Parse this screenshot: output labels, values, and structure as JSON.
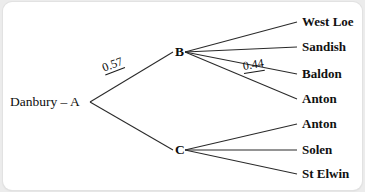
{
  "diagram": {
    "type": "probability-tree-diagram",
    "root": {
      "label": "Danbury – A",
      "x": 10,
      "y": 100
    },
    "internal_nodes": [
      {
        "id": "B",
        "label": "B",
        "x": 175,
        "y": 50
      },
      {
        "id": "C",
        "label": "C",
        "x": 175,
        "y": 148
      }
    ],
    "branch_labels": [
      {
        "text": "0.57",
        "from": "A",
        "to": "B",
        "x": 104,
        "y": 66,
        "rotation": -21
      },
      {
        "text": "0.44",
        "from": "B",
        "to": "Baldon",
        "x": 243,
        "y": 64,
        "rotation": -9
      }
    ],
    "leaves": [
      {
        "label": "West Loe",
        "parent": "B",
        "y": 20
      },
      {
        "label": "Sandish",
        "parent": "B",
        "y": 45
      },
      {
        "label": "Baldon",
        "parent": "B",
        "y": 72
      },
      {
        "label": "Anton",
        "parent": "B",
        "y": 97
      },
      {
        "label": "Anton",
        "parent": "C",
        "y": 122
      },
      {
        "label": "Solen",
        "parent": "C",
        "y": 148
      },
      {
        "label": "St Elwin",
        "parent": "C",
        "y": 172
      }
    ],
    "colors": {
      "card": "#ffffff",
      "background": "#ececec",
      "line": "#2a2a2a",
      "text": "#0d0d0d"
    }
  }
}
